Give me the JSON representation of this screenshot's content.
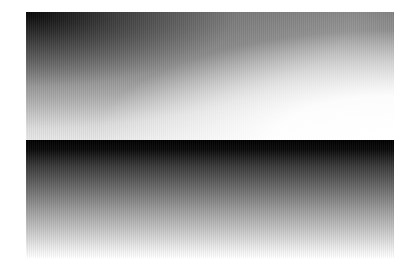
{
  "canvas": {
    "width": 415,
    "height": 272,
    "background": "#ffffff"
  },
  "panels": [
    {
      "id": "top",
      "description": "Diagonal gradient from black (top-left) to white (bottom-right)",
      "colors": {
        "start": "#000000",
        "end": "#ffffff"
      }
    },
    {
      "id": "bottom",
      "description": "Vertical gradient from black (top) to white (bottom)",
      "colors": {
        "start": "#000000",
        "end": "#ffffff"
      }
    }
  ]
}
